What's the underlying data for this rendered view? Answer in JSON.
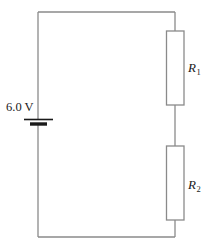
{
  "figure": {
    "type": "circuit-diagram",
    "width": 205,
    "height": 250,
    "background_color": "#ffffff",
    "wire_color": "#8a8a8a",
    "text_color": "#1a1a1a"
  },
  "source": {
    "label": "6.0 V",
    "voltage_value": "6.0",
    "voltage_unit": "V",
    "component": "battery",
    "icon": "battery-cell-icon"
  },
  "components": [
    {
      "id": "r1",
      "label_text": "R",
      "subscript": "1",
      "type": "resistor",
      "icon": "resistor-box-icon"
    },
    {
      "id": "r2",
      "label_text": "R",
      "subscript": "2",
      "type": "resistor",
      "icon": "resistor-box-icon"
    }
  ],
  "wires": {
    "loop_left_x": 38,
    "loop_right_x": 175,
    "loop_top_y": 12,
    "loop_bottom_y": 237
  }
}
